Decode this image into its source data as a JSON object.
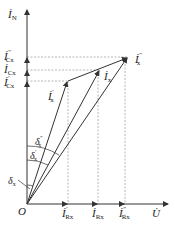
{
  "diagram": {
    "type": "phasor-diagram",
    "axes": {
      "vertical": {
        "label": "İ",
        "subscript": "N"
      },
      "horizontal": {
        "label": "U̇"
      },
      "origin": "O"
    },
    "vertical_labels": [
      {
        "main": "İ",
        "sup": "\"",
        "sub": "Cx"
      },
      {
        "main": "İ",
        "sup": "",
        "sub": "Cx"
      },
      {
        "main": "İ",
        "sup": "'",
        "sub": "Cx"
      }
    ],
    "horizontal_labels": [
      {
        "main": "İ",
        "sup": "'",
        "sub": "Rx"
      },
      {
        "main": "İ",
        "sup": "",
        "sub": "Rx"
      },
      {
        "main": "İ",
        "sup": "\"",
        "sub": "Rx"
      }
    ],
    "vectors": [
      {
        "main": "İ",
        "sup": "'",
        "sub": "x"
      },
      {
        "main": "İ",
        "sup": "",
        "sub": "x"
      },
      {
        "main": "İ",
        "sup": "\"",
        "sub": "x"
      }
    ],
    "angles": [
      {
        "main": "δ",
        "sup": "\"",
        "sub": "x"
      },
      {
        "main": "δ",
        "sup": "'",
        "sub": "x"
      },
      {
        "main": "δ",
        "sup": "",
        "sub": "x"
      }
    ],
    "colors": {
      "line": "#333333",
      "dash": "#888888"
    }
  }
}
